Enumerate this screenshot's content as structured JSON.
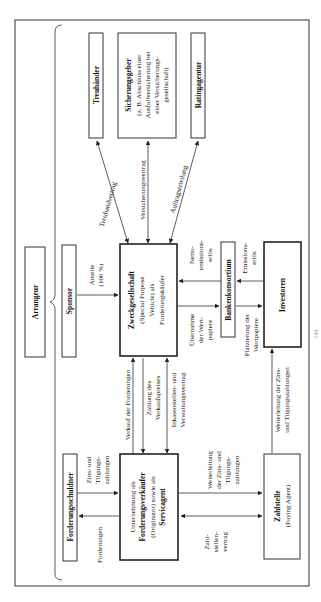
{
  "diagram": {
    "orientation": "rotated-90-ccw",
    "arranger": {
      "label": "Arrangeur"
    },
    "entities": {
      "treuhaender": {
        "label": "Treuhänder"
      },
      "sicherungsgeber": {
        "label": "Sicherungsgeber",
        "lines": [
          "(z. B. Abschluss einer",
          "Ausfallversicherung bei",
          "einer Versicherungs-",
          "gesellschaft)"
        ]
      },
      "ratingagentur": {
        "label": "Ratingagentur"
      },
      "sponsor": {
        "label": "Sponsor"
      },
      "zweckgesellschaft": {
        "label": "Zweckgesellschaft",
        "lines": [
          "(Special Purpose",
          "Vehicle) als",
          "Forderungskäufer"
        ]
      },
      "bankenkonsortium": {
        "label": "Bankenkonsortium"
      },
      "investoren": {
        "label": "Investoren"
      },
      "forderungsschuldner": {
        "label": "Forderungsschuldner"
      },
      "originator": {
        "lines": [
          "Unternehmung als"
        ],
        "bold": "Forderungsverkäufer",
        "lines2": [
          "(Originator) sowie als"
        ],
        "bold2": "Servicagent"
      },
      "zahlstelle": {
        "label": "Zahlstelle",
        "sub": "(Paying Agent)"
      }
    },
    "relations": {
      "treuhandvertrag": "Treuhandvertrag",
      "versicherungsvertrag": "Versicherungsvertrag",
      "auftragserteilung": "Auftragserteilung",
      "anteile": [
        "Anteile",
        "(100 %)"
      ],
      "netto": [
        "Netto-",
        "emissions-",
        "erlös"
      ],
      "emission": [
        "Emissions-",
        "erlös"
      ],
      "uebernahme": [
        "Übernahme",
        "der Wert-",
        "papiere"
      ],
      "platzierung": [
        "Platzierung der",
        "Wertpapiere"
      ],
      "verkauf": "Verkauf der Forderungen",
      "zahlung": [
        "Zahlung des",
        "Verkaufspreises"
      ],
      "inkasso": [
        "Inkassostellen- und",
        "Verwaltungsvertrag"
      ],
      "weiterleitung_investoren": [
        "Weiterleitung der Zins-",
        "und Tilgungszahlungen"
      ],
      "zins_tilgung": [
        "Zins- und",
        "Tilgungs-",
        "zahlungen"
      ],
      "forderungen": "Forderungen",
      "weiterleitung_zahlstelle": [
        "Weiterleitung",
        "der Zins- und",
        "Tilgungs-",
        "zahlungen"
      ],
      "zahlstellenvertrag": [
        "Zahl-",
        "stellen-",
        "vertrag"
      ]
    },
    "page_number": "144"
  }
}
